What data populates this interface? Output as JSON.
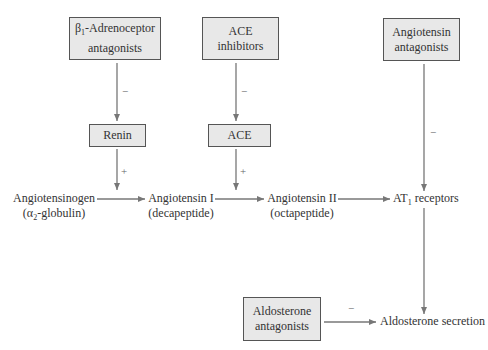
{
  "diagram": {
    "boxes": {
      "beta_blockers": {
        "line1_prefix": "β",
        "line1_sub": "1",
        "line1_rest": "-Adrenoceptor",
        "line2": "antagonists"
      },
      "ace_inhibitors": {
        "line1": "ACE",
        "line2": "inhibitors"
      },
      "angiotensin_antagonists": {
        "line1": "Angiotensin",
        "line2": "antagonists"
      },
      "renin": {
        "label": "Renin"
      },
      "ace": {
        "label": "ACE"
      },
      "aldosterone_antagonists": {
        "line1": "Aldosterone",
        "line2": "antagonists"
      }
    },
    "nodes": {
      "angiotensinogen": {
        "line1": "Angiotensinogen",
        "line2_prefix": "(α",
        "line2_sub": "2",
        "line2_rest": "-globulin)"
      },
      "angiotensin_i": {
        "line1": "Angiotensin I",
        "line2": "(decapeptide)"
      },
      "angiotensin_ii": {
        "line1": "Angiotensin II",
        "line2": "(octapeptide)"
      },
      "at1_receptors": {
        "prefix": "AT",
        "sub": "1",
        "rest": " receptors"
      },
      "aldosterone_secretion": {
        "label": "Aldosterone secretion"
      }
    },
    "signs": {
      "beta_to_renin": "−",
      "acei_to_ace": "−",
      "renin_to_conversion": "+",
      "ace_to_conversion": "+",
      "ara_to_at1": "−",
      "aldo_antag_to_secretion": "−"
    },
    "colors": {
      "box_fill": "#e8e8e8",
      "box_border": "#555555",
      "arrow": "#777777",
      "text": "#333333"
    }
  }
}
